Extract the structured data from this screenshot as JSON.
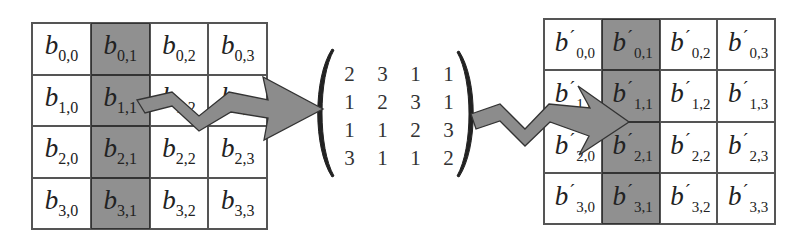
{
  "figure": {
    "colors": {
      "shaded_column": "#909090",
      "arrow_fill": "#8c8c8c",
      "border": "#555555"
    }
  },
  "input_state": {
    "symbol": "b",
    "highlighted_column": 1,
    "cells": [
      [
        {
          "row": "0",
          "col": "0"
        },
        {
          "row": "0",
          "col": "1"
        },
        {
          "row": "0",
          "col": "2"
        },
        {
          "row": "0",
          "col": "3"
        }
      ],
      [
        {
          "row": "1",
          "col": "0"
        },
        {
          "row": "1",
          "col": "1"
        },
        {
          "row": "1",
          "col": "2"
        },
        {
          "row": "1",
          "col": "3"
        }
      ],
      [
        {
          "row": "2",
          "col": "0"
        },
        {
          "row": "2",
          "col": "1"
        },
        {
          "row": "2",
          "col": "2"
        },
        {
          "row": "2",
          "col": "3"
        }
      ],
      [
        {
          "row": "3",
          "col": "0"
        },
        {
          "row": "3",
          "col": "1"
        },
        {
          "row": "3",
          "col": "2"
        },
        {
          "row": "3",
          "col": "3"
        }
      ]
    ],
    "subscripts": [
      [
        "0,0",
        "0,1",
        "0,2",
        "0,3"
      ],
      [
        "1,0",
        "1,1",
        "1,2",
        "1,3"
      ],
      [
        "2,0",
        "2,1",
        "2,2",
        "2,3"
      ],
      [
        "3,0",
        "3,1",
        "3,2",
        "3,3"
      ]
    ]
  },
  "mix_matrix": {
    "rows": [
      [
        "2",
        "3",
        "1",
        "1"
      ],
      [
        "1",
        "2",
        "3",
        "1"
      ],
      [
        "1",
        "1",
        "2",
        "3"
      ],
      [
        "3",
        "1",
        "1",
        "2"
      ]
    ]
  },
  "output_state": {
    "symbol": "b",
    "prime": "´",
    "highlighted_column": 1,
    "subscripts": [
      [
        "0,0",
        "0,1",
        "0,2",
        "0,3"
      ],
      [
        "1,0",
        "1,1",
        "1,2",
        "1,3"
      ],
      [
        "2,0",
        "2,1",
        "2,2",
        "2,3"
      ],
      [
        "3,0",
        "3,1",
        "3,2",
        "3,3"
      ]
    ]
  },
  "arrows": [
    {
      "name": "input-to-matrix",
      "from": "input_state",
      "to": "mix_matrix"
    },
    {
      "name": "matrix-to-output",
      "from": "mix_matrix",
      "to": "output_state"
    }
  ]
}
